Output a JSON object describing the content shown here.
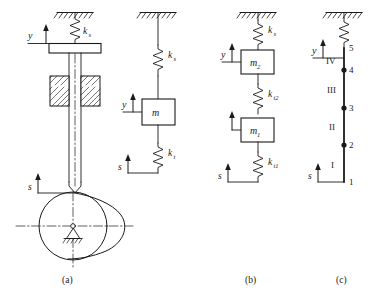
{
  "figure": {
    "caption_a": "(a)",
    "caption_b": "(b)",
    "caption_c": "(c)"
  },
  "panel_a": {
    "name": "cam-valve-mechanism",
    "label_y": "y",
    "label_s": "s",
    "spring_label": "k",
    "spring_sub": "s"
  },
  "panel_a2": {
    "name": "single-mass-model",
    "label_y": "y",
    "label_s": "s",
    "mass_label": "m",
    "spring_top": "k",
    "spring_top_sub": "s",
    "spring_bottom": "k",
    "spring_bottom_sub": "t"
  },
  "panel_b": {
    "name": "two-mass-model",
    "label_y": "y",
    "label_s": "s",
    "mass_top": "m",
    "mass_top_sub": "2",
    "mass_bottom": "m",
    "mass_bottom_sub": "1",
    "spring_top": "k",
    "spring_top_sub": "s",
    "spring_mid": "k",
    "spring_mid_sub": "t2",
    "spring_bottom": "k",
    "spring_bottom_sub": "t1"
  },
  "panel_c": {
    "name": "lumped-mass-chain-model",
    "label_y": "y",
    "label_s": "s",
    "nodes": [
      "5",
      "4",
      "3",
      "2",
      "1"
    ],
    "elements": [
      "IV",
      "III",
      "II",
      "I"
    ]
  },
  "colors": {
    "line": "#1a1a1a",
    "background": "#ffffff"
  }
}
